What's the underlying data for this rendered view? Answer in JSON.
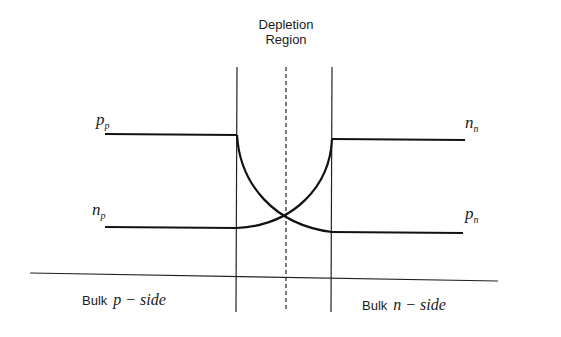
{
  "diagram": {
    "title_line1": "Depletion",
    "title_line2": "Region",
    "labels": {
      "pp_main": "p",
      "pp_sub": "p",
      "np_main": "n",
      "np_sub": "p",
      "nn_main": "n",
      "nn_sub": "n",
      "pn_main": "p",
      "pn_sub": "n"
    },
    "bulk_p": {
      "prefix": "Bulk",
      "italic": "p − side"
    },
    "bulk_n": {
      "prefix": "Bulk",
      "italic": "n − side"
    },
    "colors": {
      "line": "#111111",
      "background": "#ffffff"
    }
  }
}
